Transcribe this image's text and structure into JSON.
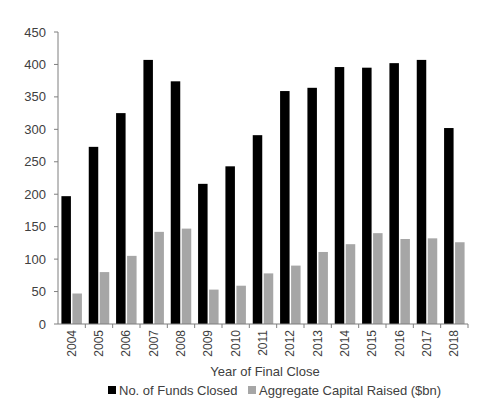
{
  "chart_data": {
    "type": "bar",
    "title": "",
    "xlabel": "Year of Final Close",
    "ylabel": "",
    "ylim": [
      0,
      450
    ],
    "yticks": [
      0,
      50,
      100,
      150,
      200,
      250,
      300,
      350,
      400,
      450
    ],
    "grid": false,
    "legend_position": "bottom",
    "categories": [
      "2004",
      "2005",
      "2006",
      "2007",
      "2008",
      "2009",
      "2010",
      "2011",
      "2012",
      "2013",
      "2014",
      "2015",
      "2016",
      "2017",
      "2018"
    ],
    "series": [
      {
        "name": "No. of Funds Closed",
        "color": "#000000",
        "values": [
          197,
          273,
          325,
          407,
          374,
          216,
          243,
          291,
          359,
          364,
          396,
          395,
          402,
          407,
          302
        ]
      },
      {
        "name": "Aggregate Capital Raised ($bn)",
        "color": "#a6a6a6",
        "values": [
          47,
          80,
          105,
          142,
          147,
          53,
          59,
          78,
          90,
          111,
          123,
          140,
          131,
          132,
          126
        ]
      }
    ]
  },
  "colors": {
    "axis": "#7f7f7f",
    "text": "#404040"
  }
}
